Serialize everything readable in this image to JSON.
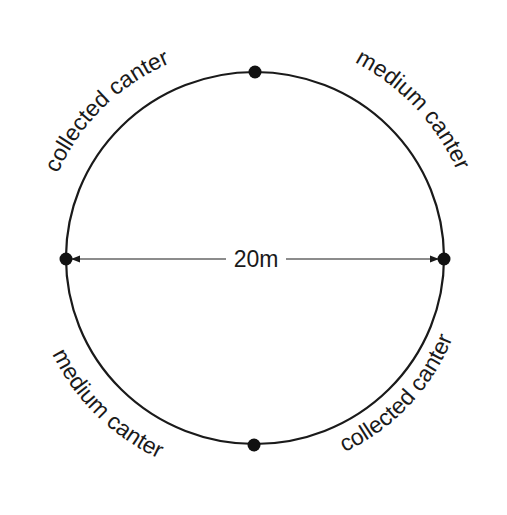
{
  "diagram": {
    "type": "riding-arena-circle",
    "diameter_label": "20m",
    "segments": [
      {
        "id": "top-left",
        "label": "collected canter"
      },
      {
        "id": "top-right",
        "label": "medium canter"
      },
      {
        "id": "bottom-left",
        "label": "medium canter"
      },
      {
        "id": "bottom-right",
        "label": "collected canter"
      }
    ],
    "markers": [
      "top",
      "right",
      "bottom",
      "left"
    ],
    "colors": {
      "stroke": "#1a1a1a",
      "background": "#ffffff"
    }
  }
}
